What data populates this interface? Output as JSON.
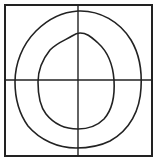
{
  "diagram": {
    "type": "contour-sketch",
    "colors": {
      "background": "#ffffff",
      "stroke": "#222222"
    },
    "frame": {
      "shape": "square",
      "x": 5,
      "y": 5,
      "width": 147,
      "height": 151
    },
    "crosshair": {
      "vertical_x": 78,
      "horizontal_y": 80
    },
    "contours": [
      {
        "name": "outer-loop",
        "top_y": 11,
        "bottom_y": 148,
        "left_x": 15,
        "right_x": 141
      },
      {
        "name": "inner-loop",
        "top_y": 33,
        "bottom_y": 129,
        "left_x": 38,
        "right_x": 114
      }
    ]
  }
}
